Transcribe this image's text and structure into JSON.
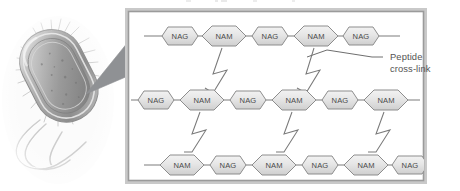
{
  "figure": {
    "title_fragment_cut_off_at_top": "",
    "panel": {
      "border_outer_color": "#9b9b9b",
      "border_inner_color": "#c9c9c9",
      "background_color": "#ffffff"
    },
    "organism": {
      "name": "rod-shaped bacterium micrograph",
      "description": "grayscale electron micrograph of a bacillus with flagella and pili",
      "body_color": "#b6b6b6",
      "outline_color": "#8a8a8a"
    },
    "callout_wedge": {
      "name": "magnification-wedge",
      "color": "#8f9194"
    },
    "annotation": {
      "line1": "Peptide",
      "line2": "cross-link",
      "text_color": "#545454",
      "leader_color": "#6e6e6e"
    },
    "glycan_chains": [
      {
        "row": "top",
        "y": 36,
        "units": [
          {
            "type": "NAG",
            "label": "NAG",
            "cx": 180
          },
          {
            "type": "NAM",
            "label": "NAM",
            "cx": 224
          },
          {
            "type": "NAG",
            "label": "NAG",
            "cx": 270
          },
          {
            "type": "NAM",
            "label": "NAM",
            "cx": 316
          },
          {
            "type": "NAG",
            "label": "NAG",
            "cx": 361
          }
        ],
        "line_start_x": 144,
        "line_end_x": 400
      },
      {
        "row": "middle",
        "y": 100,
        "units": [
          {
            "type": "NAG",
            "label": "NAG",
            "cx": 156
          },
          {
            "type": "NAM",
            "label": "NAM",
            "cx": 202
          },
          {
            "type": "NAG",
            "label": "NAG",
            "cx": 248
          },
          {
            "type": "NAM",
            "label": "NAM",
            "cx": 294
          },
          {
            "type": "NAG",
            "label": "NAG",
            "cx": 340
          },
          {
            "type": "NAM",
            "label": "NAM",
            "cx": 386
          }
        ],
        "line_start_x": 132,
        "line_end_x": 420
      },
      {
        "row": "bottom",
        "y": 165,
        "units": [
          {
            "type": "NAM",
            "label": "NAM",
            "cx": 182
          },
          {
            "type": "NAG",
            "label": "NAG",
            "cx": 228
          },
          {
            "type": "NAM",
            "label": "NAM",
            "cx": 274
          },
          {
            "type": "NAG",
            "label": "NAG",
            "cx": 320
          },
          {
            "type": "NAM",
            "label": "NAM",
            "cx": 366
          },
          {
            "type": "NAG",
            "label": "NAG",
            "cx": 410
          }
        ],
        "line_start_x": 144,
        "line_end_x": 424
      }
    ],
    "cross_links": [
      {
        "name": "crosslink-top-left",
        "from": "NAM top 1",
        "to": "NAM middle 2"
      },
      {
        "name": "crosslink-top-right",
        "from": "NAM top 2",
        "to": "NAM middle 4"
      },
      {
        "name": "crosslink-bot-left",
        "from": "NAM middle 2",
        "to": "NAM bottom 1"
      },
      {
        "name": "crosslink-bot-mid",
        "from": "NAM middle 4",
        "to": "NAM bottom 3"
      },
      {
        "name": "crosslink-bot-right",
        "from": "NAM middle 6",
        "to": "NAM bottom 5"
      }
    ],
    "colors": {
      "hex_fill_light": "#ececec",
      "hex_fill_dark": "#d4d4d4",
      "hex_stroke": "#8d8d8d",
      "chain_line": "#7d7d7d",
      "crosslink_stroke": "#7a7a7a",
      "label_text": "#4a4a4a"
    }
  }
}
